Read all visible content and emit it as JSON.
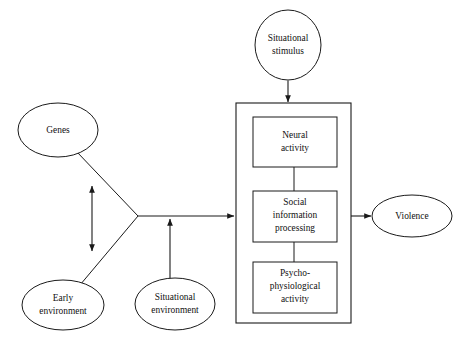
{
  "diagram": {
    "background_color": "#ffffff",
    "stroke_color": "#1a1a1a",
    "fill_color": "#ffffff",
    "nodes": [
      {
        "id": "situational-stimulus",
        "shape": "ellipse",
        "label_line1": "Situational",
        "label_line2": "stimulus",
        "cx": 288,
        "cy": 45,
        "rx": 33,
        "ry": 35
      },
      {
        "id": "genes",
        "shape": "ellipse",
        "label_line1": "Genes",
        "label_line2": "",
        "cx": 58,
        "cy": 130,
        "rx": 40,
        "ry": 27
      },
      {
        "id": "early-environment",
        "shape": "ellipse",
        "label_line1": "Early",
        "label_line2": "environment",
        "cx": 63,
        "cy": 305,
        "rx": 41,
        "ry": 25
      },
      {
        "id": "situational-environment",
        "shape": "ellipse",
        "label_line1": "Situational",
        "label_line2": "environment",
        "cx": 175,
        "cy": 304,
        "rx": 40,
        "ry": 26
      },
      {
        "id": "violence",
        "shape": "ellipse",
        "label_line1": "Violence",
        "label_line2": "",
        "cx": 412,
        "cy": 216,
        "rx": 40,
        "ry": 21
      },
      {
        "id": "neural-activity",
        "shape": "rect",
        "label_line1": "Neural",
        "label_line2": "activity",
        "x": 253,
        "y": 117,
        "width": 84,
        "height": 50
      },
      {
        "id": "social-information-processing",
        "shape": "rect",
        "label_line1": "Social",
        "label_line2": "information",
        "label_line3": "processing",
        "x": 253,
        "y": 191,
        "width": 84,
        "height": 51
      },
      {
        "id": "psycho-physiological-activity",
        "shape": "rect",
        "label_line1": "Psycho-",
        "label_line2": "physiological",
        "label_line3": "activity",
        "x": 253,
        "y": 262,
        "width": 84,
        "height": 51
      }
    ],
    "container": {
      "id": "individual-container",
      "label": "",
      "x": 236,
      "y": 103,
      "width": 115,
      "height": 220
    },
    "edges": [
      {
        "id": "stimulus-to-container",
        "from": "situational-stimulus",
        "to": "individual-container",
        "arrow": "single",
        "direction": "down"
      },
      {
        "id": "genes-to-apex",
        "from": "genes",
        "to": "apex",
        "arrow": "none",
        "direction": "diagonal"
      },
      {
        "id": "early-environment-to-apex",
        "from": "early-environment",
        "to": "apex",
        "arrow": "none",
        "direction": "diagonal"
      },
      {
        "id": "genes-early-environment-bidirectional",
        "from": "genes",
        "to": "early-environment",
        "arrow": "double",
        "direction": "vertical"
      },
      {
        "id": "apex-to-container",
        "from": "apex",
        "to": "individual-container",
        "arrow": "single",
        "direction": "right"
      },
      {
        "id": "situational-environment-to-apex-line",
        "from": "situational-environment",
        "to": "apex-line",
        "arrow": "single",
        "direction": "up"
      },
      {
        "id": "neural-to-social",
        "from": "neural-activity",
        "to": "social-information-processing",
        "arrow": "none",
        "direction": "vertical"
      },
      {
        "id": "social-to-psychophysiological",
        "from": "social-information-processing",
        "to": "psycho-physiological-activity",
        "arrow": "none",
        "direction": "vertical"
      },
      {
        "id": "container-to-violence",
        "from": "individual-container",
        "to": "violence",
        "arrow": "single",
        "direction": "right"
      }
    ]
  }
}
